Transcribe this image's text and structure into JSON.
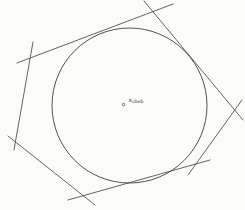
{
  "figure": {
    "background_color": "#fbfbf9",
    "stroke_color": "#3e3e3e",
    "label": {
      "variable": "x",
      "subscript": "cheb"
    },
    "marker": {
      "x": 123.5,
      "y": 104.6,
      "r": 1.3
    },
    "inscribed_circle": {
      "cx": 129.5,
      "cy": 105.5,
      "r": 77.5
    },
    "edges": [
      {
        "name": "edge-top",
        "x1": 17,
        "y1": 63,
        "x2": 173,
        "y2": 4
      },
      {
        "name": "edge-upper-right",
        "x1": 144,
        "y1": 1,
        "x2": 243,
        "y2": 120
      },
      {
        "name": "edge-lower-right",
        "x1": 242,
        "y1": 100,
        "x2": 188,
        "y2": 175
      },
      {
        "name": "edge-bottom",
        "x1": 68,
        "y1": 200,
        "x2": 210,
        "y2": 160
      },
      {
        "name": "edge-lower-left",
        "x1": 8,
        "y1": 136,
        "x2": 95,
        "y2": 205
      },
      {
        "name": "edge-left",
        "x1": 33,
        "y1": 42,
        "x2": 14,
        "y2": 150
      }
    ]
  }
}
